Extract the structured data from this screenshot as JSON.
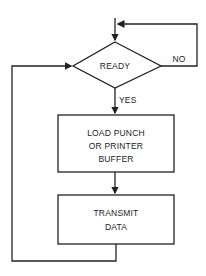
{
  "flowchart": {
    "decision": {
      "label": "READY"
    },
    "branches": {
      "yes": "YES",
      "no": "NO"
    },
    "process1": {
      "line1": "LOAD PUNCH",
      "line2": "OR PRINTER",
      "line3": "BUFFER"
    },
    "process2": {
      "line1": "TRANSMIT",
      "line2": "DATA"
    },
    "colors": {
      "stroke": "#222222",
      "background": "#ffffff"
    }
  }
}
